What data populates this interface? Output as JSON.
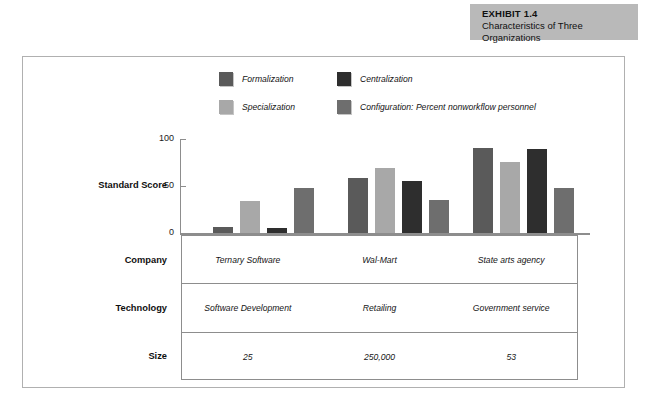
{
  "exhibit": {
    "number": "EXHIBIT 1.4",
    "title": "Characteristics of Three Organizations",
    "band_color": "#b9b9b9"
  },
  "chart_data": {
    "type": "bar",
    "title": "Characteristics of Three Organizations",
    "xlabel": "",
    "ylabel": "Standard Score",
    "ylim": [
      0,
      100
    ],
    "yticks": [
      "0",
      "50",
      "100"
    ],
    "grid": false,
    "legend_position": "top",
    "categories": [
      "Ternary Software",
      "Wal-Mart",
      "State arts agency"
    ],
    "series": [
      {
        "name": "Formalization",
        "color": "#5a5a5a",
        "values": [
          6,
          57,
          89
        ]
      },
      {
        "name": "Specialization",
        "color": "#a8a8a8",
        "values": [
          33,
          68,
          74
        ]
      },
      {
        "name": "Centralization",
        "color": "#2e2e2e",
        "values": [
          5,
          54,
          88
        ]
      },
      {
        "name": "Configuration: Percent nonworkflow personnel",
        "color": "#6e6e6e",
        "values": [
          47,
          34,
          47
        ]
      }
    ]
  },
  "axis": {
    "y_title": "Standard Score",
    "ticks": [
      {
        "label": "100",
        "value": 100
      },
      {
        "label": "50",
        "value": 50
      },
      {
        "label": "0",
        "value": 0
      }
    ]
  },
  "table": {
    "rows": [
      {
        "header": "Company",
        "cells": [
          "Ternary Software",
          "Wal-Mart",
          "State arts agency"
        ]
      },
      {
        "header": "Technology",
        "cells": [
          "Software Development",
          "Retailing",
          "Government service"
        ]
      },
      {
        "header": "Size",
        "cells": [
          "25",
          "250,000",
          "53"
        ]
      }
    ]
  }
}
